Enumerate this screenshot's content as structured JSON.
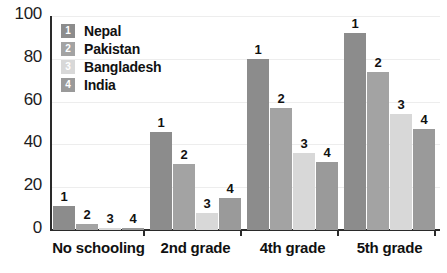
{
  "chart_data": {
    "type": "bar",
    "title": "",
    "subtitle": "",
    "xlabel": "",
    "ylabel": "",
    "categories": [
      "No schooling",
      "2nd grade",
      "4th grade",
      "5th grade"
    ],
    "series": [
      {
        "name": "Nepal",
        "key": "1",
        "color": "#8c8c8c",
        "values": [
          11,
          46,
          80,
          92
        ]
      },
      {
        "name": "Pakistan",
        "key": "2",
        "color": "#a3a3a3",
        "values": [
          3,
          31,
          57,
          74
        ]
      },
      {
        "name": "Bangladesh",
        "key": "3",
        "color": "#d8d8d8",
        "values": [
          1,
          8,
          36,
          54
        ]
      },
      {
        "name": "India",
        "key": "4",
        "color": "#9a9a9a",
        "values": [
          1,
          15,
          32,
          47
        ]
      }
    ],
    "bar_labels": [
      [
        "1",
        "2",
        "3",
        "4"
      ],
      [
        "1",
        "2",
        "3",
        "4"
      ],
      [
        "1",
        "2",
        "3",
        "4"
      ],
      [
        "1",
        "2",
        "3",
        "4"
      ]
    ],
    "ylim": [
      0,
      100
    ],
    "yticks": [
      0,
      20,
      40,
      60,
      80,
      100
    ],
    "ytick_labels": [
      "0",
      "20",
      "40",
      "60",
      "80",
      "100"
    ],
    "grid": true,
    "grid_axis": "y",
    "legend_position": "top-left",
    "legend": [
      {
        "key": "1",
        "label": "Nepal",
        "color": "#8c8c8c"
      },
      {
        "key": "2",
        "label": "Pakistan",
        "color": "#a3a3a3"
      },
      {
        "key": "3",
        "label": "Bangladesh",
        "color": "#d8d8d8"
      },
      {
        "key": "4",
        "label": "India",
        "color": "#9a9a9a"
      }
    ]
  },
  "colors": {
    "axis": "#2a2a2a",
    "grid": "#ededed",
    "text": "#111111",
    "background": "#ffffff"
  }
}
